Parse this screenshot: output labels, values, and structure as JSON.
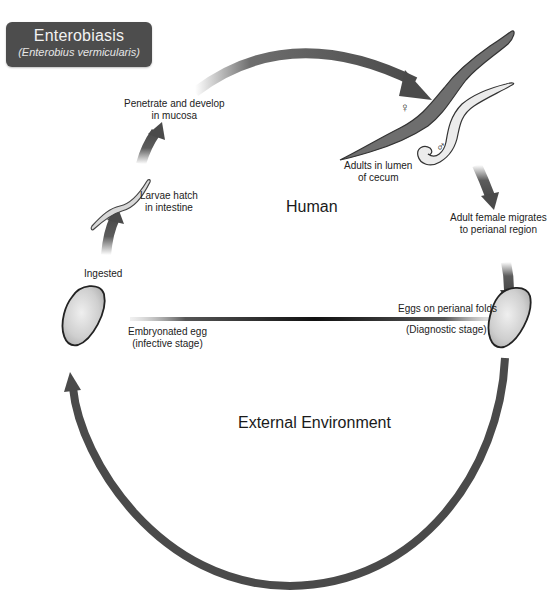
{
  "title": {
    "main": "Enterobiasis",
    "subtitle": "(Enterobius vermicularis)"
  },
  "regions": {
    "human": "Human",
    "external": "External Environment"
  },
  "stages": [
    {
      "id": "ingested",
      "lines": [
        "Ingested"
      ]
    },
    {
      "id": "larvae",
      "lines": [
        "Larvae hatch",
        "in intestine"
      ]
    },
    {
      "id": "penetrate",
      "lines": [
        "Penetrate and develop",
        "in mucosa"
      ]
    },
    {
      "id": "adults",
      "lines": [
        "Adults in lumen",
        "of cecum"
      ]
    },
    {
      "id": "migrates",
      "lines": [
        "Adult female migrates",
        "to perianal region"
      ]
    },
    {
      "id": "eggs_perianal",
      "lines": [
        "Eggs on perianal folds"
      ]
    },
    {
      "id": "diagnostic",
      "lines": [
        "(Diagnostic stage)"
      ]
    },
    {
      "id": "embryonated",
      "lines": [
        "Embryonated egg",
        "(infective stage)"
      ]
    }
  ],
  "symbols": {
    "female": "♀",
    "male": "♂"
  },
  "colors": {
    "arrow": "#4a4a4a",
    "title_bg": "#4d4d4d",
    "egg_fill": "#d9d9d9",
    "female_worm": "#6e6e6e",
    "male_worm": "#e8e8e8"
  }
}
